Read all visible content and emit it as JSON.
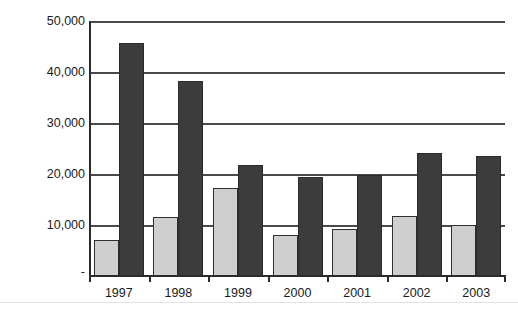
{
  "chart_data": {
    "type": "bar",
    "title": "",
    "subtitle": "",
    "xlabel": "",
    "ylabel": "",
    "categories": [
      "1997",
      "1998",
      "1999",
      "2000",
      "2001",
      "2002",
      "2003"
    ],
    "series": [
      {
        "name": "series-1",
        "color": "#cfcfcf",
        "values": [
          7000,
          11600,
          17200,
          8100,
          9300,
          11700,
          10000
        ]
      },
      {
        "name": "series-2",
        "color": "#3c3c3c",
        "values": [
          45700,
          38300,
          21800,
          19400,
          19800,
          24100,
          23500
        ]
      }
    ],
    "ylim": [
      0,
      50000
    ],
    "yticks": [
      0,
      10000,
      20000,
      30000,
      40000,
      50000
    ],
    "ytick_labels": [
      "-",
      "10,000",
      "20,000",
      "30,000",
      "40,000",
      "50,000"
    ],
    "grid": true,
    "grid_axis": "y",
    "legend": false,
    "legend_position": "none"
  },
  "axis": {
    "line_color": "#2b2b2b",
    "grid_color": "#4a4a4a"
  }
}
